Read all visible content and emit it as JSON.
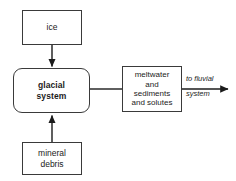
{
  "diagram": {
    "background_color": "#ffffff",
    "stroke_color": "#3a3a3a",
    "text_color": "#1b1b1b",
    "nodes": [
      {
        "id": "ice",
        "label": "ice",
        "shape": "rectangle",
        "bold": false
      },
      {
        "id": "glacial-system",
        "label": "glacial\nsystem",
        "shape": "rounded-rectangle",
        "bold": true
      },
      {
        "id": "meltwater",
        "label": "meltwater\nand\nsediments\nand solutes",
        "shape": "rectangle",
        "bold": false
      },
      {
        "id": "mineral-debris",
        "label": "mineral\ndebris",
        "shape": "rectangle",
        "bold": false
      }
    ],
    "edges": [
      {
        "id": "ice-to-glacial-system",
        "from": "ice",
        "to": "glacial-system",
        "direction": "down",
        "arrowhead": true
      },
      {
        "id": "mineral-debris-to-glacial-system",
        "from": "mineral-debris",
        "to": "glacial-system",
        "direction": "up",
        "arrowhead": true
      },
      {
        "id": "glacial-system-to-meltwater",
        "from": "glacial-system",
        "to": "meltwater",
        "direction": "right",
        "arrowhead": false
      },
      {
        "id": "meltwater-to-fluvial-system",
        "from": "meltwater",
        "to": "fluvial-system",
        "direction": "right",
        "arrowhead": true
      }
    ],
    "captions": [
      {
        "id": "to-fluvial-system",
        "text": "to fluvial\nsystem",
        "italic": true
      }
    ]
  }
}
